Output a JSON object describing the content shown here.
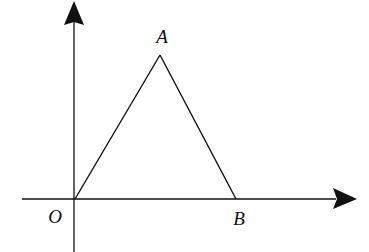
{
  "diagram": {
    "type": "coordinate-geometry",
    "axes": {
      "x_axis": {
        "from": [
          22,
          199
        ],
        "to": [
          357,
          199
        ],
        "arrow": true
      },
      "y_axis": {
        "from": [
          74,
          252
        ],
        "to": [
          74,
          0
        ],
        "arrow": true
      }
    },
    "points": [
      {
        "name": "O",
        "label": "O",
        "pos": [
          74,
          199
        ],
        "label_pos": [
          55,
          222
        ]
      },
      {
        "name": "A",
        "label": "A",
        "pos": [
          160,
          55
        ],
        "label_pos": [
          162,
          43
        ]
      },
      {
        "name": "B",
        "label": "B",
        "pos": [
          236,
          199
        ],
        "label_pos": [
          238,
          225
        ]
      }
    ],
    "segments": [
      {
        "from": "O",
        "to": "A"
      },
      {
        "from": "A",
        "to": "B"
      },
      {
        "from": "O",
        "to": "B"
      }
    ],
    "colors": {
      "stroke": "#111111",
      "background": "#ffffff"
    }
  },
  "labels": {
    "O": "O",
    "A": "A",
    "B": "B"
  }
}
